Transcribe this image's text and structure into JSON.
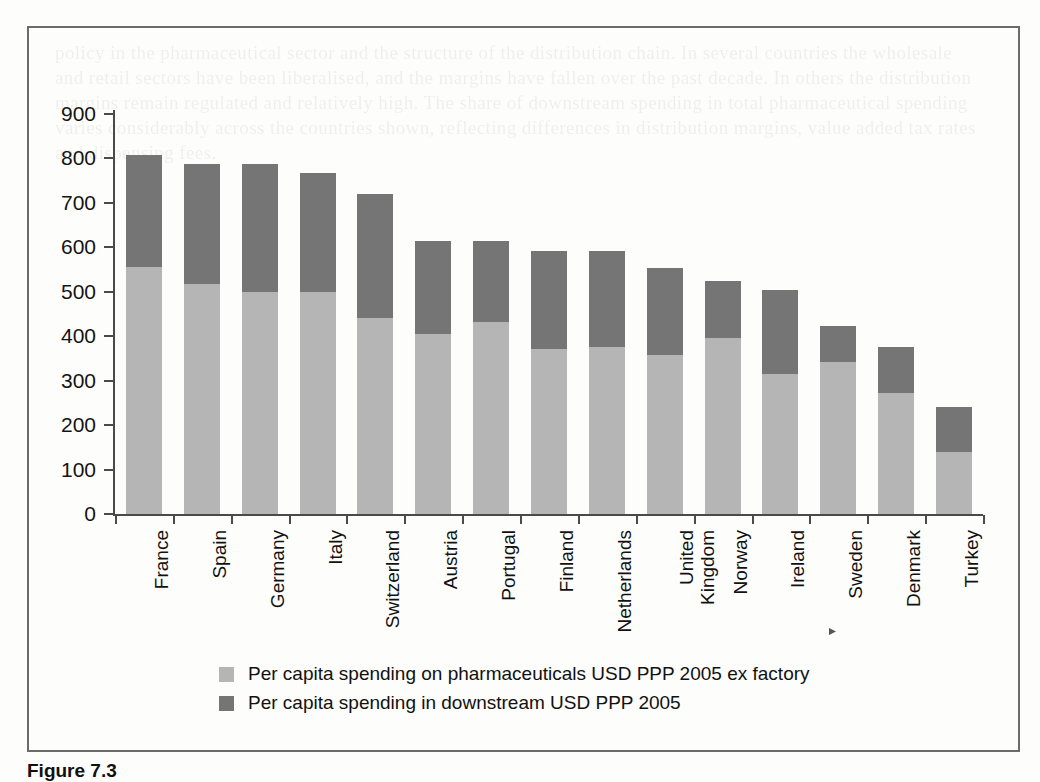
{
  "figure": {
    "caption_label": "Figure 7.3",
    "caption_rest": ""
  },
  "axes": {
    "y_ticks": [
      0,
      100,
      200,
      300,
      400,
      500,
      600,
      700,
      800,
      900
    ],
    "y_min": 0,
    "y_max": 900,
    "y_label": "",
    "x_label": ""
  },
  "legend": {
    "position": "bottom",
    "items": [
      {
        "label": "Per capita spending on pharmaceuticals USD PPP 2005 ex factory",
        "color": "#b5b5b5",
        "swatch_name": "legend-swatch-ex-factory"
      },
      {
        "label": "Per capita spending in downstream USD PPP 2005",
        "color": "#757575",
        "swatch_name": "legend-swatch-downstream"
      }
    ]
  },
  "colors": {
    "ex_factory": "#b5b5b5",
    "downstream": "#757575",
    "axis": "#4a4a4a",
    "frame": "#6b6b6b",
    "text": "#111111"
  },
  "ghost_text": "policy in the pharmaceutical sector and the structure of the distribution chain. In several countries the wholesale and retail sectors have been liberalised, and the margins have fallen over the past decade. In others the distribution margins remain regulated and relatively high. The share of downstream spending in total pharmaceutical spending varies considerably across the countries shown, reflecting differences in distribution margins, value added tax rates and dispensing fees.",
  "chart_data": {
    "type": "bar",
    "subtype": "stacked-vertical",
    "title": "",
    "xlabel": "",
    "ylabel": "",
    "ylim": [
      0,
      900
    ],
    "ytick_step": 100,
    "grid": false,
    "legend_position": "bottom",
    "categories": [
      "France",
      "Spain",
      "Germany",
      "Italy",
      "Switzerland",
      "Austria",
      "Portugal",
      "Finland",
      "Netherlands",
      "United Kingdom",
      "Norway",
      "Ireland",
      "Sweden",
      "Denmark",
      "Turkey"
    ],
    "category_label_lines": [
      [
        "France"
      ],
      [
        "Spain"
      ],
      [
        "Germany"
      ],
      [
        "Italy"
      ],
      [
        "Switzerland"
      ],
      [
        "Austria"
      ],
      [
        "Portugal"
      ],
      [
        "Finland"
      ],
      [
        "Netherlands"
      ],
      [
        "United",
        "Kingdom"
      ],
      [
        "Norway"
      ],
      [
        "Ireland"
      ],
      [
        "Sweden"
      ],
      [
        "Denmark"
      ],
      [
        "Turkey"
      ]
    ],
    "series": [
      {
        "name": "Per capita spending on pharmaceuticals USD PPP 2005 ex factory",
        "short_name": "ex factory",
        "color": "#b5b5b5",
        "values": [
          555,
          517,
          500,
          500,
          440,
          405,
          432,
          372,
          375,
          357,
          397,
          315,
          342,
          272,
          140
        ]
      },
      {
        "name": "Per capita spending in downstream USD PPP 2005",
        "short_name": "downstream",
        "color": "#757575",
        "values": [
          252,
          270,
          288,
          268,
          280,
          210,
          182,
          220,
          217,
          197,
          128,
          190,
          80,
          103,
          100
        ]
      }
    ],
    "totals": [
      807,
      787,
      788,
      768,
      720,
      615,
      614,
      592,
      592,
      554,
      525,
      505,
      422,
      375,
      240
    ]
  }
}
